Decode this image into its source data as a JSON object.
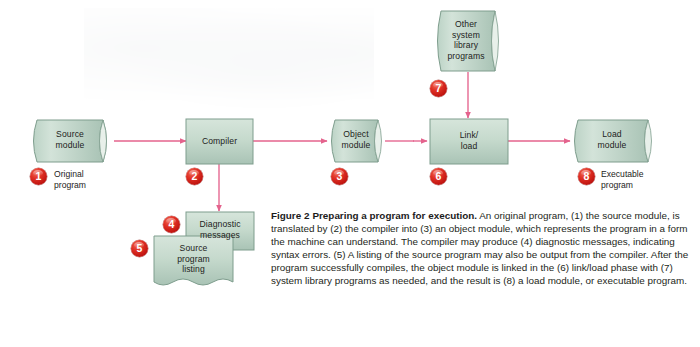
{
  "figure": {
    "number_label": "Figure 2",
    "title": "Preparing a program for execution.",
    "caption_body": "An original program, (1) the source module, is translated by (2) the compiler into (3) an object module, which represents the program in a form the machine can understand. The compiler may produce (4) diagnostic messages, indicating syntax errors. (5) A listing of the source program may also be output from the compiler. After the program successfully compiles, the object module is linked in the (6) link/load phase with (7) system library programs as needed, and the result is (8) a load module, or executable program."
  },
  "colors": {
    "node_fill_light": "#cfe0d6",
    "node_fill_dark": "#adc6b8",
    "node_stroke": "#7e9d8d",
    "arrow": "#e4638d",
    "bullet_red": "#d02a22",
    "text": "#1d1d1b"
  },
  "nodes": [
    {
      "id": "source-module",
      "shape": "tape-cylinder",
      "label": "Source\nmodule"
    },
    {
      "id": "compiler",
      "shape": "rectangle",
      "label": "Compiler"
    },
    {
      "id": "object-module",
      "shape": "tape-cylinder",
      "label": "Object\nmodule"
    },
    {
      "id": "link-load",
      "shape": "rectangle",
      "label": "Link/\nload"
    },
    {
      "id": "load-module",
      "shape": "tape-cylinder",
      "label": "Load\nmodule"
    },
    {
      "id": "other-system-library",
      "shape": "tape-cylinder",
      "label": "Other\nsystem\nlibrary\nprograms"
    },
    {
      "id": "diagnostic-messages",
      "shape": "rectangle",
      "label": "Diagnostic\nmessages"
    },
    {
      "id": "source-program-listing",
      "shape": "document",
      "label": "Source\nprogram\nlisting"
    }
  ],
  "bullets": [
    {
      "id": "bullet-1",
      "number": "1",
      "caption": "Original\nprogram"
    },
    {
      "id": "bullet-2",
      "number": "2",
      "caption": ""
    },
    {
      "id": "bullet-3",
      "number": "3",
      "caption": ""
    },
    {
      "id": "bullet-4",
      "number": "4",
      "caption": ""
    },
    {
      "id": "bullet-5",
      "number": "5",
      "caption": ""
    },
    {
      "id": "bullet-6",
      "number": "6",
      "caption": ""
    },
    {
      "id": "bullet-7",
      "number": "7",
      "caption": ""
    },
    {
      "id": "bullet-8",
      "number": "8",
      "caption": "Executable\nprogram"
    }
  ]
}
